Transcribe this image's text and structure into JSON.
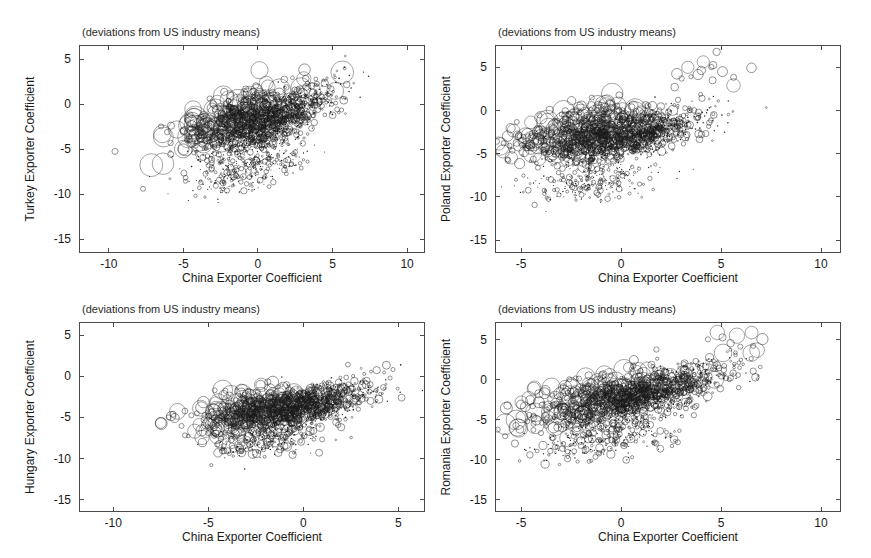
{
  "figure": {
    "panel_title": "(deviations from US industry means)",
    "xlabel": "China Exporter Coefficient"
  },
  "chart_data": [
    {
      "type": "scatter",
      "id": "turkey",
      "title": "(deviations from US industry means)",
      "xlabel": "China Exporter Coefficient",
      "ylabel": "Turkey Exporter Coefficient",
      "xlim": [
        -12.0,
        11.2
      ],
      "ylim": [
        -16.5,
        6.6
      ],
      "xticks": [
        -10,
        -5,
        0,
        5,
        10
      ],
      "yticks": [
        5,
        0,
        -5,
        -10,
        -15
      ],
      "xticklabels": [
        "-10",
        "-5",
        "0",
        "5",
        "10"
      ],
      "yticklabels": [
        "5",
        "0",
        "-5",
        "-10",
        "-15"
      ],
      "grid": false,
      "legend": "none",
      "marker": "open-circle",
      "marker_size_encodes": "firm employment weight",
      "n_points": 1800,
      "cloud": {
        "main": {
          "x_mean": 0.9,
          "y_mean": -1.9,
          "x_sd": 2.05,
          "y_sd": 1.95,
          "rho": 0.76,
          "n": 1150,
          "r_min": 0.7,
          "r_max": 4.0,
          "r_skew": 3.1
        },
        "halo": {
          "x_mean": -1.6,
          "y_mean": -1.4,
          "x_sd": 2.1,
          "y_sd": 1.7,
          "rho": 0.68,
          "n": 330,
          "r_min": 2.5,
          "r_max": 11.5,
          "r_skew": 2.4
        },
        "tail": {
          "x_mean": -0.6,
          "y_mean": -6.9,
          "x_sd": 2.1,
          "y_sd": 1.6,
          "rho": 0.52,
          "n": 320,
          "r_min": 0.5,
          "r_max": 3.2,
          "r_skew": 3.4
        }
      }
    },
    {
      "type": "scatter",
      "id": "poland",
      "title": "(deviations from US industry means)",
      "xlabel": "China Exporter Coefficient",
      "ylabel": "Poland Exporter Coefficient",
      "xlim": [
        -6.3,
        11.0
      ],
      "ylim": [
        -16.5,
        7.6
      ],
      "xticks": [
        -5,
        0,
        5,
        10
      ],
      "yticks": [
        5,
        0,
        -5,
        -10,
        -15
      ],
      "xticklabels": [
        "-5",
        "0",
        "5",
        "10"
      ],
      "yticklabels": [
        "5",
        "0",
        "-5",
        "-10",
        "-15"
      ],
      "grid": false,
      "legend": "none",
      "marker": "open-circle",
      "marker_size_encodes": "firm employment weight",
      "n_points": 1900,
      "cloud": {
        "main": {
          "x_mean": 0.4,
          "y_mean": -2.9,
          "x_sd": 1.85,
          "y_sd": 1.55,
          "rho": 0.6,
          "n": 1200,
          "r_min": 0.7,
          "r_max": 4.2,
          "r_skew": 3.0
        },
        "halo": {
          "x_mean": -2.3,
          "y_mean": -2.3,
          "x_sd": 1.7,
          "y_sd": 1.6,
          "rho": 0.5,
          "n": 340,
          "r_min": 2.5,
          "r_max": 11.0,
          "r_skew": 2.4
        },
        "tail": {
          "x_mean": -1.4,
          "y_mean": -8.2,
          "x_sd": 1.6,
          "y_sd": 1.2,
          "rho": 0.4,
          "n": 260,
          "r_min": 0.5,
          "r_max": 3.0,
          "r_skew": 3.4
        },
        "outliers": {
          "x_mean": 4.9,
          "y_mean": 4.8,
          "x_sd": 1.2,
          "y_sd": 1.2,
          "rho": 0.3,
          "n": 16,
          "r_min": 2.0,
          "r_max": 8.0,
          "r_skew": 1.6
        }
      }
    },
    {
      "type": "scatter",
      "id": "hungary",
      "title": "(deviations from US industry means)",
      "xlabel": "China Exporter Coefficient",
      "ylabel": "Hungary Exporter Coefficient",
      "xlim": [
        -11.8,
        6.4
      ],
      "ylim": [
        -16.5,
        6.6
      ],
      "xticks": [
        -10,
        -5,
        0,
        5
      ],
      "yticks": [
        5,
        0,
        -5,
        -10,
        -15
      ],
      "xticklabels": [
        "-10",
        "-5",
        "0",
        "5"
      ],
      "yticklabels": [
        "5",
        "0",
        "-5",
        "-10",
        "-15"
      ],
      "grid": false,
      "legend": "none",
      "marker": "open-circle",
      "marker_size_encodes": "firm employment weight",
      "n_points": 1700,
      "cloud": {
        "main": {
          "x_mean": 0.1,
          "y_mean": -3.6,
          "x_sd": 1.75,
          "y_sd": 1.45,
          "rho": 0.62,
          "n": 1100,
          "r_min": 0.7,
          "r_max": 4.0,
          "r_skew": 3.0
        },
        "halo": {
          "x_mean": -2.6,
          "y_mean": -4.1,
          "x_sd": 1.6,
          "y_sd": 1.5,
          "rho": 0.52,
          "n": 330,
          "r_min": 2.5,
          "r_max": 10.0,
          "r_skew": 2.4
        },
        "tail": {
          "x_mean": -1.9,
          "y_mean": -7.8,
          "x_sd": 1.5,
          "y_sd": 1.1,
          "rho": 0.35,
          "n": 230,
          "r_min": 0.6,
          "r_max": 4.5,
          "r_skew": 3.0
        }
      }
    },
    {
      "type": "scatter",
      "id": "romania",
      "title": "(deviations from US industry means)",
      "xlabel": "China Exporter Coefficient",
      "ylabel": "Romania Exporter Coefficient",
      "xlim": [
        -6.3,
        11.0
      ],
      "ylim": [
        -16.5,
        7.2
      ],
      "xticks": [
        -5,
        0,
        5,
        10
      ],
      "yticks": [
        5,
        0,
        -5,
        -10,
        -15
      ],
      "xticklabels": [
        "-5",
        "0",
        "5",
        "10"
      ],
      "yticklabels": [
        "5",
        "0",
        "-5",
        "-10",
        "-15"
      ],
      "grid": false,
      "legend": "none",
      "marker": "open-circle",
      "marker_size_encodes": "firm employment weight",
      "n_points": 1750,
      "cloud": {
        "main": {
          "x_mean": 1.4,
          "y_mean": -1.9,
          "x_sd": 1.9,
          "y_sd": 1.85,
          "rho": 0.74,
          "n": 1100,
          "r_min": 0.7,
          "r_max": 4.2,
          "r_skew": 3.0
        },
        "halo": {
          "x_mean": -1.2,
          "y_mean": -2.3,
          "x_sd": 1.9,
          "y_sd": 1.8,
          "rho": 0.62,
          "n": 330,
          "r_min": 2.5,
          "r_max": 10.5,
          "r_skew": 2.4
        },
        "tail": {
          "x_mean": -0.4,
          "y_mean": -7.2,
          "x_sd": 1.9,
          "y_sd": 1.5,
          "rho": 0.5,
          "n": 280,
          "r_min": 0.6,
          "r_max": 4.2,
          "r_skew": 3.2
        },
        "outliers": {
          "x_mean": 5.8,
          "y_mean": 4.4,
          "x_sd": 1.1,
          "y_sd": 1.1,
          "rho": 0.35,
          "n": 14,
          "r_min": 2.5,
          "r_max": 8.5,
          "r_skew": 1.6
        }
      }
    }
  ],
  "layout": {
    "panels": [
      {
        "id": "turkey",
        "frame": {
          "x": 79,
          "y": 45,
          "w": 346,
          "h": 208
        }
      },
      {
        "id": "poland",
        "frame": {
          "x": 495,
          "y": 45,
          "w": 346,
          "h": 208
        }
      },
      {
        "id": "hungary",
        "frame": {
          "x": 79,
          "y": 322,
          "w": 346,
          "h": 190
        }
      },
      {
        "id": "romania",
        "frame": {
          "x": 495,
          "y": 322,
          "w": 346,
          "h": 190
        }
      }
    ]
  }
}
